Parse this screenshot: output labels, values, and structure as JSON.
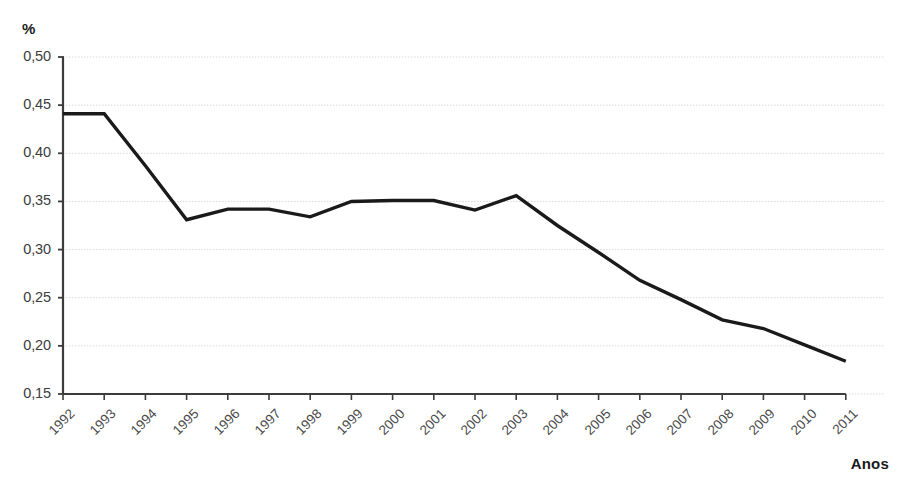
{
  "chart_data": {
    "type": "line",
    "title": "",
    "subtitle": "",
    "xlabel": "Anos",
    "ylabel": "%",
    "categories": [
      "1992",
      "1993",
      "1994",
      "1995",
      "1996",
      "1997",
      "1998",
      "1999",
      "2000",
      "2001",
      "2002",
      "2003",
      "2004",
      "2005",
      "2006",
      "2007",
      "2008",
      "2009",
      "2010",
      "2011"
    ],
    "values": [
      0.441,
      0.441,
      0.387,
      0.331,
      0.342,
      0.342,
      0.334,
      0.35,
      0.351,
      0.351,
      0.341,
      0.356,
      0.325,
      0.297,
      0.268,
      0.248,
      0.227,
      0.218,
      0.201,
      0.184
    ],
    "series": [
      {
        "name": "",
        "values": [
          0.441,
          0.441,
          0.387,
          0.331,
          0.342,
          0.342,
          0.334,
          0.35,
          0.351,
          0.351,
          0.341,
          0.356,
          0.325,
          0.297,
          0.268,
          0.248,
          0.227,
          0.218,
          0.201,
          0.184
        ]
      }
    ],
    "ylim": [
      0.15,
      0.5
    ],
    "y_ticks": [
      0.5,
      0.45,
      0.4,
      0.35,
      0.3,
      0.25,
      0.2,
      0.15
    ],
    "y_tick_labels": [
      "0,50",
      "0,45",
      "0,40",
      "0,35",
      "0,30",
      "0,25",
      "0,20",
      "0,15"
    ],
    "grid": true,
    "grid_axis": "y",
    "legend": false,
    "legend_position": "none",
    "line_color": "#1a1a1a",
    "grid_color": "#d9d9d9",
    "axis_color": "#3c3c3c",
    "background_color": "#ffffff",
    "annotations": []
  }
}
